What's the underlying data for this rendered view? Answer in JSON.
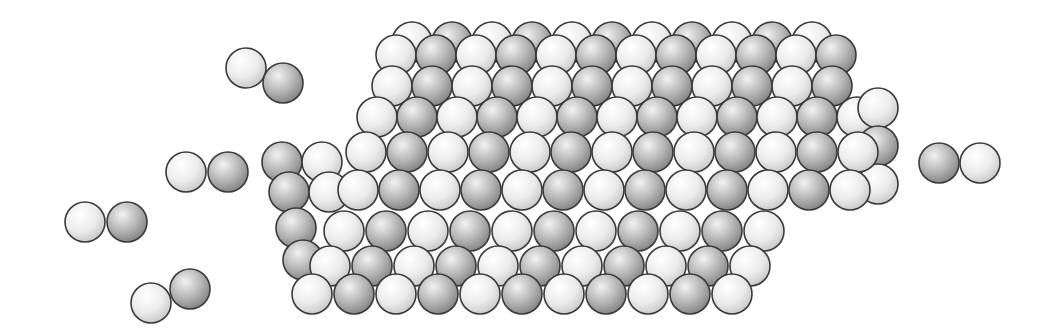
{
  "canvas": {
    "width": 1048,
    "height": 334,
    "background": "#ffffff"
  },
  "colors": {
    "light": {
      "hi": "#ffffff",
      "mid": "#ececec",
      "lo": "#c4c4c4"
    },
    "dark": {
      "hi": "#f2f2f2",
      "mid": "#b4b4b4",
      "lo": "#7c7c7c"
    },
    "stroke": "#3a3a3a"
  },
  "radius": 20,
  "molecules": [
    {
      "name": "molecule-top-left",
      "atoms": [
        {
          "x": 246,
          "y": 68,
          "type": "light"
        },
        {
          "x": 283,
          "y": 83,
          "type": "dark"
        }
      ]
    },
    {
      "name": "molecule-mid-left",
      "atoms": [
        {
          "x": 186,
          "y": 172,
          "type": "light"
        },
        {
          "x": 228,
          "y": 172,
          "type": "dark"
        }
      ]
    },
    {
      "name": "molecule-far-left",
      "atoms": [
        {
          "x": 85,
          "y": 222,
          "type": "light"
        },
        {
          "x": 127,
          "y": 222,
          "type": "dark"
        }
      ]
    },
    {
      "name": "molecule-bottom-left",
      "atoms": [
        {
          "x": 151,
          "y": 303,
          "type": "light"
        },
        {
          "x": 190,
          "y": 289,
          "type": "dark"
        }
      ]
    },
    {
      "name": "molecule-right",
      "atoms": [
        {
          "x": 939,
          "y": 163,
          "type": "dark"
        },
        {
          "x": 980,
          "y": 163,
          "type": "light"
        }
      ]
    }
  ],
  "lattice_rows": [
    {
      "name": "back-top-row-a",
      "x0": 412,
      "y0": 42,
      "dx": 40,
      "count": 11,
      "start": "light"
    },
    {
      "name": "back-top-row-b",
      "x0": 396,
      "y0": 55,
      "dx": 40,
      "count": 12,
      "start": "light"
    },
    {
      "name": "back-row-1",
      "x0": 392,
      "y0": 86,
      "dx": 40,
      "count": 12,
      "start": "light"
    },
    {
      "name": "back-row-2",
      "x0": 377,
      "y0": 117,
      "dx": 40,
      "count": 13,
      "start": "light"
    },
    {
      "name": "right-face-col",
      "x0": 878,
      "y0": 108,
      "dx": 0,
      "dy": 38,
      "count": 3,
      "start": "light",
      "vertical": true
    },
    {
      "name": "left-face-row-1",
      "x0": 282,
      "y0": 162,
      "dx": 40,
      "count": 2,
      "start": "dark"
    },
    {
      "name": "main-row-1",
      "x0": 366,
      "y0": 152,
      "dx": 41,
      "count": 13,
      "start": "light"
    },
    {
      "name": "left-face-row-2",
      "x0": 289,
      "y0": 192,
      "dx": 40,
      "count": 2,
      "start": "dark"
    },
    {
      "name": "main-row-2",
      "x0": 358,
      "y0": 190,
      "dx": 41,
      "count": 13,
      "start": "light"
    },
    {
      "name": "left-face-row-3",
      "x0": 296,
      "y0": 228,
      "dx": 40,
      "count": 1,
      "start": "dark"
    },
    {
      "name": "main-row-3",
      "x0": 344,
      "y0": 231,
      "dx": 42,
      "count": 11,
      "start": "light"
    },
    {
      "name": "left-face-row-4",
      "x0": 303,
      "y0": 260,
      "dx": 40,
      "count": 1,
      "start": "dark"
    },
    {
      "name": "main-row-4",
      "x0": 330,
      "y0": 266,
      "dx": 42,
      "count": 11,
      "start": "light"
    },
    {
      "name": "main-row-5",
      "x0": 312,
      "y0": 294,
      "dx": 42,
      "count": 11,
      "start": "light"
    }
  ],
  "labels": {
    "title": "Crystal lattice surface with approaching diatomic molecules"
  }
}
